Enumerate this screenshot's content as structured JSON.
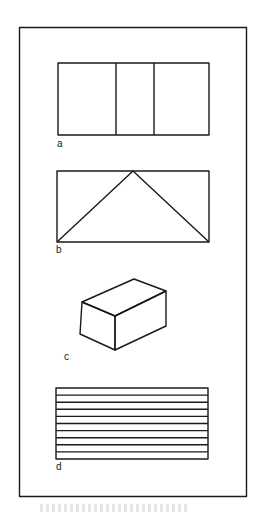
{
  "figure": {
    "panels": [
      {
        "id": "a",
        "label": "a",
        "shape": "rectangle divided into three vertical sections"
      },
      {
        "id": "b",
        "label": "b",
        "shape": "rectangle with inscribed triangle (apex at top center)"
      },
      {
        "id": "c",
        "label": "c",
        "shape": "rectangular box drawn in perspective"
      },
      {
        "id": "d",
        "label": "d",
        "shape": "rectangle with 10 horizontal stripes"
      }
    ],
    "colors": {
      "stroke": "#1a1a1a",
      "background": "#ffffff"
    }
  }
}
